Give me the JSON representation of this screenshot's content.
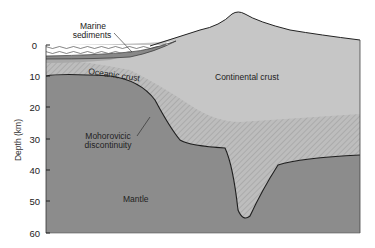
{
  "diagram": {
    "type": "cross-section",
    "y_axis": {
      "title": "Depth (km)",
      "ticks": [
        "0",
        "10",
        "20",
        "30",
        "40",
        "50",
        "60"
      ]
    },
    "labels": {
      "marine_sediments_line1": "Marine",
      "marine_sediments_line2": "sediments",
      "oceanic_crust": "Oceanic crust",
      "continental_crust": "Continental crust",
      "moho_line1": "Mohorovicic",
      "moho_line2": "discontinuity",
      "mantle": "Mantle"
    },
    "colors": {
      "mantle": "#8a8a8a",
      "continental_crust": "#c4c4c4",
      "lower_crust_hatch": "#b3b3b3",
      "oceanic_crust": "#a8a8a8",
      "sediments": "#9c9c9c",
      "ocean": "#ffffff",
      "outline": "#222222"
    },
    "layers": [
      {
        "name": "Ocean water",
        "depth_km": "0–3"
      },
      {
        "name": "Marine sediments",
        "depth_km": "~3–5"
      },
      {
        "name": "Oceanic crust",
        "depth_km": "~5–10"
      },
      {
        "name": "Continental crust",
        "depth_km": "surface to ~35, root to ~55"
      },
      {
        "name": "Mantle",
        "depth_km": "below Moho to 60+"
      }
    ]
  }
}
